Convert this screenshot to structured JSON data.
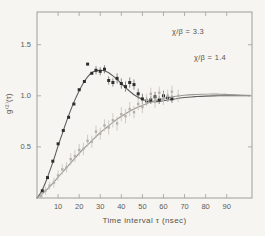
{
  "figure": {
    "background": "#f6f5f1",
    "ylabel_display": "g⁽²⁾(τ)",
    "annotations": [
      {
        "text": "χ/β = 3.3"
      },
      {
        "text": "χ/β = 1.4"
      }
    ]
  },
  "chart_data": {
    "type": "line",
    "title": "",
    "xlabel": "Time interval τ (nsec)",
    "ylabel": "g(2)(τ)",
    "xlim": [
      0,
      102
    ],
    "ylim": [
      0,
      1.82
    ],
    "x_ticks": [
      10,
      20,
      30,
      40,
      50,
      60,
      70,
      80,
      90
    ],
    "y_ticks": [
      0.5,
      1.0,
      1.5
    ],
    "grid": false,
    "legend": "none",
    "frame": {
      "left": 37,
      "top": 12,
      "right": 252,
      "bottom": 198
    },
    "tick_len": 4,
    "axis_color": "#a09e98",
    "tick_label_color": "#5d5b56",
    "annotations": [
      {
        "text": "χ/β = 3.3",
        "x": 70,
        "y": 1.62
      },
      {
        "text": "χ/β = 1.4",
        "x": 81,
        "y": 1.38
      }
    ],
    "series": [
      {
        "name": "chi/beta = 3.3 theory curve",
        "kind": "curve",
        "color": "#5f5f5f",
        "width": 1.1,
        "points": [
          [
            0,
            0.0
          ],
          [
            2,
            0.06
          ],
          [
            4,
            0.15
          ],
          [
            6,
            0.26
          ],
          [
            8,
            0.38
          ],
          [
            10,
            0.51
          ],
          [
            12,
            0.63
          ],
          [
            14,
            0.75
          ],
          [
            16,
            0.86
          ],
          [
            18,
            0.96
          ],
          [
            20,
            1.05
          ],
          [
            22,
            1.125
          ],
          [
            24,
            1.185
          ],
          [
            26,
            1.225
          ],
          [
            28,
            1.245
          ],
          [
            30,
            1.25
          ],
          [
            32,
            1.245
          ],
          [
            34,
            1.225
          ],
          [
            36,
            1.195
          ],
          [
            38,
            1.16
          ],
          [
            40,
            1.12
          ],
          [
            42,
            1.08
          ],
          [
            44,
            1.045
          ],
          [
            46,
            1.01
          ],
          [
            48,
            0.985
          ],
          [
            50,
            0.965
          ],
          [
            52,
            0.952
          ],
          [
            54,
            0.944
          ],
          [
            56,
            0.942
          ],
          [
            58,
            0.945
          ],
          [
            60,
            0.952
          ],
          [
            63,
            0.962
          ],
          [
            66,
            0.972
          ],
          [
            70,
            0.983
          ],
          [
            75,
            0.992
          ],
          [
            80,
            0.997
          ],
          [
            86,
            1.0
          ],
          [
            92,
            1.001
          ],
          [
            101,
            1.001
          ]
        ]
      },
      {
        "name": "chi/beta = 1.4 theory curve",
        "kind": "curve",
        "color": "#9b9891",
        "width": 1.1,
        "points": [
          [
            0,
            0.0
          ],
          [
            3,
            0.05
          ],
          [
            6,
            0.11
          ],
          [
            9,
            0.18
          ],
          [
            12,
            0.25
          ],
          [
            15,
            0.32
          ],
          [
            18,
            0.39
          ],
          [
            21,
            0.46
          ],
          [
            24,
            0.52
          ],
          [
            27,
            0.58
          ],
          [
            30,
            0.64
          ],
          [
            33,
            0.69
          ],
          [
            36,
            0.74
          ],
          [
            39,
            0.785
          ],
          [
            42,
            0.825
          ],
          [
            45,
            0.86
          ],
          [
            48,
            0.89
          ],
          [
            51,
            0.915
          ],
          [
            54,
            0.94
          ],
          [
            57,
            0.958
          ],
          [
            60,
            0.973
          ],
          [
            63,
            0.985
          ],
          [
            66,
            0.995
          ],
          [
            70,
            1.005
          ],
          [
            74,
            1.012
          ],
          [
            78,
            1.016
          ],
          [
            82,
            1.018
          ],
          [
            86,
            1.017
          ],
          [
            90,
            1.014
          ],
          [
            95,
            1.009
          ],
          [
            101,
            1.004
          ]
        ]
      },
      {
        "name": "chi/beta = 3.3 data points",
        "kind": "scatter",
        "marker": "square",
        "size": 3,
        "color": "#2e2e2e",
        "err_color": "#6f6d68",
        "points": [
          [
            2.5,
            0.07,
            0
          ],
          [
            5,
            0.2,
            0
          ],
          [
            7.5,
            0.36,
            0
          ],
          [
            10,
            0.53,
            0
          ],
          [
            12.5,
            0.66,
            0
          ],
          [
            15,
            0.79,
            0
          ],
          [
            17.5,
            0.92,
            0
          ],
          [
            20,
            1.06,
            0
          ],
          [
            22.5,
            1.14,
            0
          ],
          [
            24,
            1.31,
            0
          ],
          [
            26,
            1.22,
            0
          ],
          [
            28,
            1.25,
            0.04
          ],
          [
            30,
            1.24,
            0.04
          ],
          [
            32,
            1.26,
            0.04
          ],
          [
            34,
            1.15,
            0.04
          ],
          [
            36,
            1.13,
            0.04
          ],
          [
            38,
            1.17,
            0.05
          ],
          [
            40,
            1.12,
            0.05
          ],
          [
            42,
            1.09,
            0.05
          ],
          [
            44,
            1.13,
            0.05
          ],
          [
            46,
            1.11,
            0.05
          ],
          [
            48,
            1.02,
            0.05
          ],
          [
            50,
            0.97,
            0.05
          ],
          [
            52,
            0.95,
            0.04
          ],
          [
            54,
            0.96,
            0.04
          ],
          [
            56,
            0.99,
            0.05
          ],
          [
            58,
            0.96,
            0.04
          ],
          [
            60,
            1.0,
            0.05
          ],
          [
            62,
            0.98,
            0.04
          ],
          [
            64,
            0.97,
            0.04
          ]
        ]
      },
      {
        "name": "chi/beta = 1.4 data points",
        "kind": "scatter",
        "marker": "square",
        "size": 2.4,
        "color": "#b4b1ab",
        "err_color": "#c4c1bb",
        "points": [
          [
            2,
            0.02,
            0.03
          ],
          [
            4,
            0.07,
            0.04
          ],
          [
            6,
            0.12,
            0.04
          ],
          [
            8,
            0.15,
            0.05
          ],
          [
            10,
            0.22,
            0.05
          ],
          [
            12,
            0.28,
            0.05
          ],
          [
            14,
            0.3,
            0.05
          ],
          [
            16,
            0.38,
            0.06
          ],
          [
            18,
            0.41,
            0.06
          ],
          [
            20,
            0.47,
            0.06
          ],
          [
            22,
            0.48,
            0.06
          ],
          [
            24,
            0.56,
            0.06
          ],
          [
            26,
            0.55,
            0.06
          ],
          [
            28,
            0.65,
            0.06
          ],
          [
            30,
            0.63,
            0.06
          ],
          [
            32,
            0.71,
            0.06
          ],
          [
            34,
            0.69,
            0.07
          ],
          [
            36,
            0.76,
            0.07
          ],
          [
            38,
            0.73,
            0.07
          ],
          [
            40,
            0.82,
            0.07
          ],
          [
            42,
            0.8,
            0.07
          ],
          [
            44,
            0.87,
            0.07
          ],
          [
            46,
            0.84,
            0.06
          ],
          [
            48,
            0.92,
            0.06
          ],
          [
            50,
            0.89,
            0.06
          ],
          [
            52,
            0.96,
            0.06
          ],
          [
            54,
            1.02,
            0.06
          ],
          [
            56,
            0.94,
            0.06
          ],
          [
            58,
            1.03,
            0.06
          ],
          [
            60,
            0.97,
            0.06
          ],
          [
            62,
            1.0,
            0.06
          ],
          [
            64,
            1.04,
            0.06
          ],
          [
            67,
            1.0,
            0.06
          ]
        ]
      }
    ]
  }
}
